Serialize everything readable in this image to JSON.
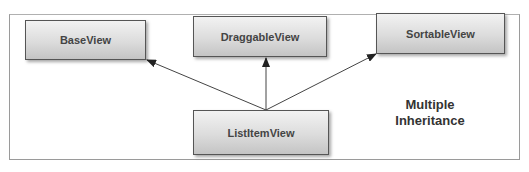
{
  "diagram": {
    "title": "Multiple Inheritance",
    "caption_lines": [
      "Multiple",
      "Inheritance"
    ],
    "nodes": [
      {
        "id": "base",
        "label": "BaseView"
      },
      {
        "id": "draggable",
        "label": "DraggableView"
      },
      {
        "id": "sortable",
        "label": "SortableView"
      },
      {
        "id": "listitem",
        "label": "ListItemView"
      }
    ],
    "edges": [
      {
        "from": "listitem",
        "to": "base"
      },
      {
        "from": "listitem",
        "to": "draggable"
      },
      {
        "from": "listitem",
        "to": "sortable"
      }
    ],
    "colors": {
      "border": "#555555",
      "arrow": "#333333",
      "text": "#444444"
    }
  }
}
